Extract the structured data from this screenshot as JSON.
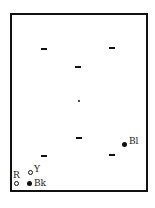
{
  "diagram": {
    "type": "spatial-layout-schematic",
    "frame": {
      "shape": "rectangle",
      "color": "#111111"
    },
    "dash_marks": [
      {
        "x": 44,
        "y": 49
      },
      {
        "x": 112,
        "y": 48
      },
      {
        "x": 78,
        "y": 67
      },
      {
        "x": 78,
        "y": 138
      },
      {
        "x": 44,
        "y": 156
      },
      {
        "x": 112,
        "y": 155
      }
    ],
    "center_dot": {
      "x": 79,
      "y": 101
    },
    "labeled_markers": [
      {
        "id": "bl",
        "label": "Bl",
        "marker": "filled-dot"
      },
      {
        "id": "y",
        "label": "Y",
        "marker": "ring"
      },
      {
        "id": "r",
        "label": "R",
        "marker": "ring"
      },
      {
        "id": "bk",
        "label": "Bk",
        "marker": "filled-dot"
      }
    ]
  }
}
